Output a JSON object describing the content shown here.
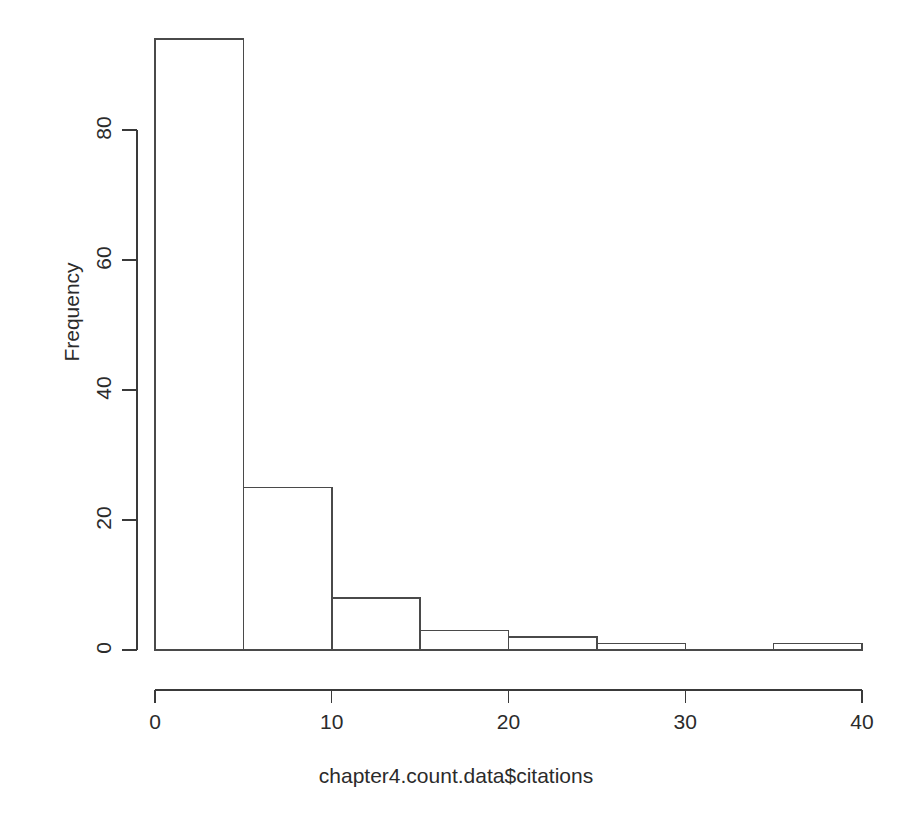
{
  "chart_data": {
    "type": "bar",
    "subtype": "histogram",
    "title": "",
    "subtitle": "",
    "xlabel": "chapter4.count.data$citations",
    "ylabel": "Frequency",
    "bin_width": 5,
    "bin_edges": [
      0,
      5,
      10,
      15,
      20,
      25,
      30,
      35,
      40
    ],
    "categories": [
      "0-5",
      "5-10",
      "10-15",
      "15-20",
      "20-25",
      "25-30",
      "30-35",
      "35-40"
    ],
    "values": [
      94,
      25,
      8,
      3,
      2,
      1,
      0,
      1
    ],
    "xlim": [
      0,
      40
    ],
    "ylim": [
      0,
      94
    ],
    "x_ticks": [
      0,
      10,
      20,
      30,
      40
    ],
    "x_tick_labels": [
      "0",
      "10",
      "20",
      "30",
      "40"
    ],
    "y_ticks": [
      0,
      20,
      40,
      60,
      80
    ],
    "y_tick_labels": [
      "0",
      "20",
      "40",
      "60",
      "80"
    ],
    "grid": false,
    "legend": false,
    "legend_position": "none",
    "bar_fill": "none",
    "bar_stroke": "#4a4a4a",
    "axis_color": "#3a3a3a",
    "background": "#ffffff"
  },
  "axes": {
    "x_title": "chapter4.count.data$citations",
    "y_title": "Frequency"
  }
}
